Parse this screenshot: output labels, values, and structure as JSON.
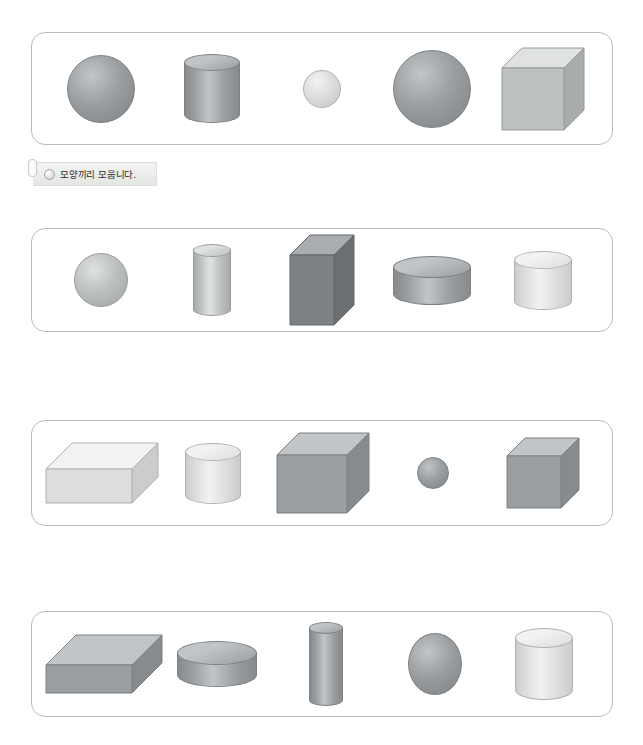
{
  "page": {
    "top_cut_text": "",
    "background_color": "#ffffff",
    "box_border_color": "#b9bcbf"
  },
  "label": {
    "text": "모양끼리 모웁니다.",
    "bullet_icon": "circle-bullet-icon"
  },
  "palette": {
    "dark_gray": "#8e9296",
    "mid_gray": "#a8abae",
    "light_gray": "#cfd2d3",
    "pale_gray": "#e2e4e3",
    "outline": "#8e9295"
  },
  "rows": [
    {
      "id": "row-1",
      "top": 32,
      "left": 31,
      "width": 582,
      "height": 113,
      "shapes": [
        {
          "name": "sphere",
          "label": "구",
          "w": 66,
          "h": 66,
          "tone": "mid",
          "offset_y": 0
        },
        {
          "name": "cylinder",
          "label": "원기둥",
          "w": 56,
          "h": 60,
          "tone": "mid",
          "ellipse_h": 17,
          "offset_y": 0
        },
        {
          "name": "sphere",
          "label": "구",
          "w": 36,
          "h": 36,
          "tone": "pale",
          "offset_y": 0
        },
        {
          "name": "sphere",
          "label": "구",
          "w": 76,
          "h": 76,
          "tone": "mid",
          "offset_y": 0
        },
        {
          "name": "cube",
          "label": "정육면체",
          "w": 62,
          "h": 62,
          "depth": 20,
          "tone": "light",
          "offset_y": 0
        }
      ]
    },
    {
      "id": "row-2",
      "top": 228,
      "left": 31,
      "width": 582,
      "height": 104,
      "shapes": [
        {
          "name": "sphere",
          "label": "구",
          "w": 52,
          "h": 52,
          "tone": "light",
          "offset_y": 0
        },
        {
          "name": "cylinder",
          "label": "원기둥",
          "w": 38,
          "h": 66,
          "tone": "light",
          "ellipse_h": 13,
          "offset_y": 0
        },
        {
          "name": "cuboid",
          "label": "직육면체",
          "w": 44,
          "h": 70,
          "depth": 20,
          "tone": "dark",
          "offset_y": 0
        },
        {
          "name": "cylinder",
          "label": "납작한 원기둥",
          "w": 78,
          "h": 38,
          "tone": "mid",
          "ellipse_h": 22,
          "offset_y": 0
        },
        {
          "name": "cylinder",
          "label": "원기둥",
          "w": 58,
          "h": 50,
          "tone": "pale",
          "ellipse_h": 18,
          "offset_y": 0
        }
      ]
    },
    {
      "id": "row-3",
      "top": 420,
      "left": 31,
      "width": 582,
      "height": 106,
      "shapes": [
        {
          "name": "flat-cuboid",
          "label": "직육면체",
          "w": 86,
          "h": 34,
          "depth": 26,
          "tone": "pale",
          "offset_y": 0
        },
        {
          "name": "cylinder",
          "label": "원기둥",
          "w": 56,
          "h": 52,
          "tone": "pale",
          "ellipse_h": 18,
          "offset_y": 0
        },
        {
          "name": "cube",
          "label": "정육면체",
          "w": 70,
          "h": 58,
          "depth": 22,
          "tone": "mid",
          "offset_y": 0
        },
        {
          "name": "sphere",
          "label": "구",
          "w": 30,
          "h": 30,
          "tone": "mid",
          "offset_y": 0
        },
        {
          "name": "cube",
          "label": "정육면체",
          "w": 54,
          "h": 52,
          "depth": 18,
          "tone": "mid",
          "offset_y": 0
        }
      ]
    },
    {
      "id": "row-4",
      "top": 611,
      "left": 31,
      "width": 582,
      "height": 106,
      "shapes": [
        {
          "name": "slab",
          "label": "직육면체",
          "w": 86,
          "h": 28,
          "depth": 30,
          "tone": "mid",
          "offset_y": 0
        },
        {
          "name": "cylinder",
          "label": "납작한 원기둥",
          "w": 80,
          "h": 34,
          "tone": "mid",
          "ellipse_h": 24,
          "offset_y": 0
        },
        {
          "name": "cylinder",
          "label": "긴 원기둥",
          "w": 34,
          "h": 78,
          "tone": "mid",
          "ellipse_h": 12,
          "offset_y": 0
        },
        {
          "name": "sphere",
          "label": "구",
          "w": 52,
          "h": 60,
          "tone": "mid",
          "offset_y": 0
        },
        {
          "name": "cylinder",
          "label": "원기둥",
          "w": 58,
          "h": 62,
          "tone": "pale",
          "ellipse_h": 20,
          "offset_y": 0
        }
      ]
    }
  ]
}
